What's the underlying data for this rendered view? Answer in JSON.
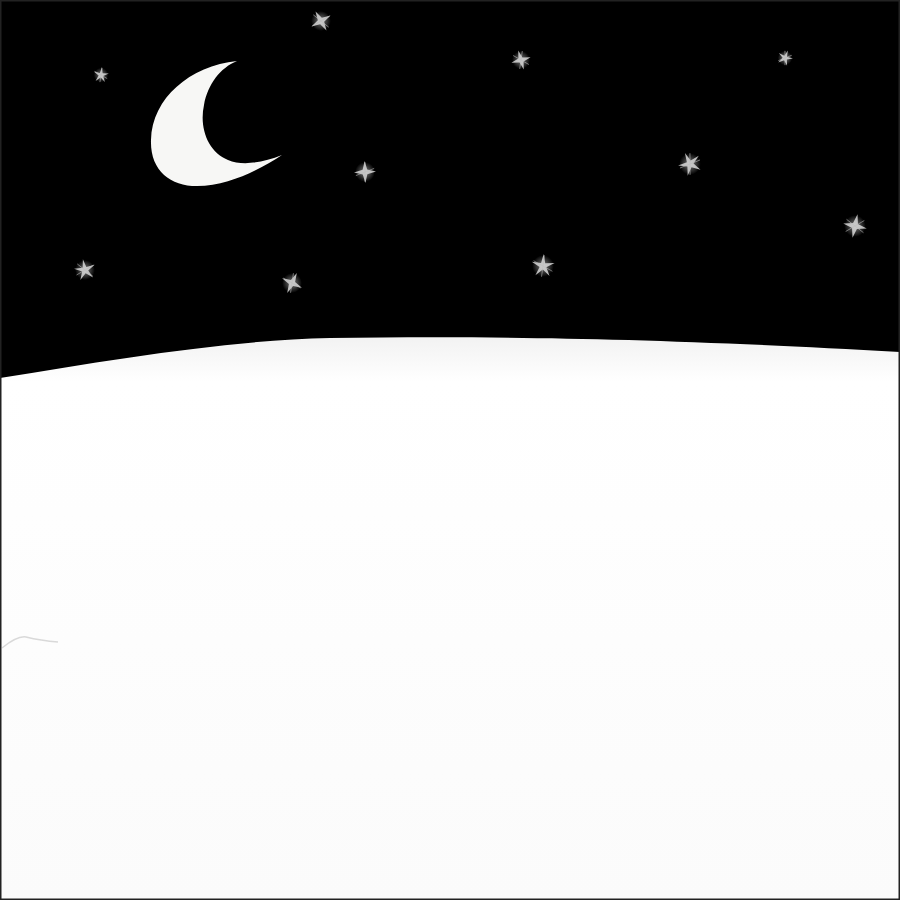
{
  "scene": {
    "description": "Paper-cut style night scene: crescent moon and sketchy stars over a snowy field",
    "colors": {
      "sky": "#000000",
      "snow": "#ffffff",
      "snow_shadow": "#eeeeee",
      "moon": "#f7f7f5",
      "star": "#d8d8d8",
      "border": "#222222"
    },
    "moon": {
      "cx": 215,
      "cy": 122,
      "label": "crescent-moon"
    },
    "stars": [
      {
        "x": 321,
        "y": 21,
        "size": 11
      },
      {
        "x": 101,
        "y": 75,
        "size": 8
      },
      {
        "x": 521,
        "y": 60,
        "size": 10
      },
      {
        "x": 785,
        "y": 58,
        "size": 8
      },
      {
        "x": 365,
        "y": 172,
        "size": 11
      },
      {
        "x": 690,
        "y": 164,
        "size": 12
      },
      {
        "x": 855,
        "y": 226,
        "size": 12
      },
      {
        "x": 85,
        "y": 270,
        "size": 11
      },
      {
        "x": 292,
        "y": 283,
        "size": 11
      },
      {
        "x": 543,
        "y": 266,
        "size": 12
      }
    ],
    "horizon": "M0,378 C110,360 230,340 330,338 C500,336 650,338 900,352"
  }
}
